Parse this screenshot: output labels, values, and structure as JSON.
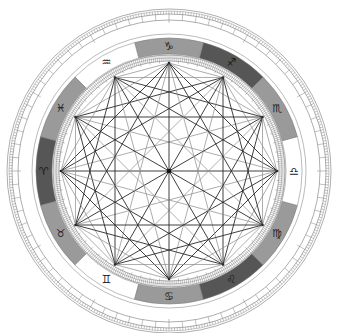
{
  "chart": {
    "type": "astrology-wheel",
    "center": [
      169,
      171
    ],
    "radii": {
      "outer_ring_outer": 162,
      "outer_ring_mid": 157,
      "outer_ring_inner": 151,
      "gap_circle": 137,
      "zodiac_outer": 133,
      "zodiac_inner": 117,
      "inner_ticks_outer": 116,
      "inner_ticks_inner": 110,
      "polygon": 108
    },
    "colors": {
      "dark": "#565656",
      "medium": "#9a9a9a",
      "light": "#ffffff",
      "line_dark": "#2a2a2a",
      "line_light": "#8a8a8a",
      "ring_stroke": "#777777"
    },
    "signs": [
      {
        "name": "Aries",
        "glyph": "♈",
        "angle": 180,
        "shade": "dark"
      },
      {
        "name": "Taurus",
        "glyph": "♉",
        "angle": 210,
        "shade": "medium"
      },
      {
        "name": "Gemini",
        "glyph": "♊",
        "angle": 240,
        "shade": "light"
      },
      {
        "name": "Cancer",
        "glyph": "♋",
        "angle": 270,
        "shade": "medium"
      },
      {
        "name": "Leo",
        "glyph": "♌",
        "angle": 300,
        "shade": "dark"
      },
      {
        "name": "Virgo",
        "glyph": "♍",
        "angle": 330,
        "shade": "medium"
      },
      {
        "name": "Libra",
        "glyph": "♎",
        "angle": 0,
        "shade": "light"
      },
      {
        "name": "Scorpio",
        "glyph": "♏",
        "angle": 30,
        "shade": "medium"
      },
      {
        "name": "Sagittarius",
        "glyph": "♐",
        "angle": 60,
        "shade": "dark"
      },
      {
        "name": "Capricorn",
        "glyph": "♑",
        "angle": 90,
        "shade": "medium"
      },
      {
        "name": "Aquarius",
        "glyph": "♒",
        "angle": 120,
        "shade": "light"
      },
      {
        "name": "Pisces",
        "glyph": "♓",
        "angle": 150,
        "shade": "medium"
      }
    ],
    "polygon_points": 12,
    "center_dot": true
  }
}
